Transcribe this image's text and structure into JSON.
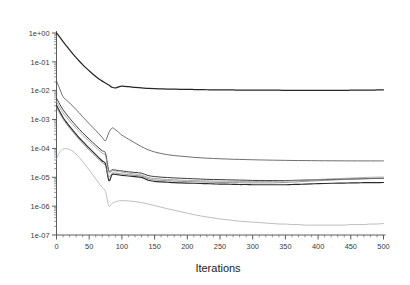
{
  "chart_data": {
    "type": "line",
    "title": "",
    "xlabel": "Iterations",
    "ylabel": "",
    "yscale": "log",
    "xlim": [
      0,
      500
    ],
    "ylim": [
      1e-07,
      1
    ],
    "grid": false,
    "legend": "none",
    "xticks": [
      0,
      50,
      100,
      150,
      200,
      250,
      300,
      350,
      400,
      450,
      500
    ],
    "xtick_labels": [
      "0",
      "50",
      "100",
      "150",
      "200",
      "250",
      "300",
      "350",
      "400",
      "450",
      "500"
    ],
    "yticks": [
      1,
      0.1,
      0.01,
      0.001,
      0.0001,
      1e-05,
      1e-06,
      1e-07
    ],
    "ytick_labels": [
      "1e+00",
      "1e-01",
      "1e-02",
      "1e-03",
      "1e-04",
      "1e-05",
      "1e-06",
      "1e-07"
    ],
    "x": [
      0,
      5,
      10,
      15,
      20,
      25,
      30,
      35,
      40,
      45,
      50,
      55,
      60,
      65,
      70,
      75,
      80,
      85,
      90,
      95,
      100,
      110,
      120,
      130,
      140,
      150,
      160,
      170,
      180,
      190,
      200,
      210,
      220,
      230,
      240,
      250,
      260,
      270,
      280,
      290,
      300,
      310,
      320,
      330,
      340,
      350,
      360,
      370,
      380,
      390,
      400,
      410,
      420,
      430,
      440,
      450,
      460,
      470,
      480,
      490,
      500
    ],
    "series": [
      {
        "name": "curve-1-top",
        "color": "#262626",
        "width": 1.25,
        "values": [
          1.0,
          0.72,
          0.5,
          0.36,
          0.26,
          0.19,
          0.14,
          0.105,
          0.08,
          0.062,
          0.049,
          0.039,
          0.031,
          0.0255,
          0.0215,
          0.0185,
          0.0158,
          0.0132,
          0.0125,
          0.0136,
          0.0143,
          0.0138,
          0.0131,
          0.0125,
          0.0121,
          0.0118,
          0.0116,
          0.0114,
          0.0113,
          0.0112,
          0.0111,
          0.011,
          0.0109,
          0.0108,
          0.0107,
          0.0107,
          0.0106,
          0.0106,
          0.0105,
          0.0105,
          0.0105,
          0.0104,
          0.0104,
          0.0104,
          0.0104,
          0.0103,
          0.0103,
          0.0103,
          0.0103,
          0.0103,
          0.0102,
          0.0102,
          0.0103,
          0.0103,
          0.0103,
          0.0104,
          0.0104,
          0.0105,
          0.0105,
          0.0106,
          0.0107
        ]
      },
      {
        "name": "curve-2",
        "color": "#555555",
        "width": 0.85,
        "values": [
          0.022,
          0.0115,
          0.0062,
          0.0048,
          0.0038,
          0.0029,
          0.0022,
          0.0017,
          0.00125,
          0.00095,
          0.00072,
          0.00055,
          0.00042,
          0.00032,
          0.00024,
          0.000185,
          0.00035,
          0.00051,
          0.00045,
          0.00036,
          0.00029,
          0.00021,
          0.000155,
          0.000115,
          9e-05,
          7.55e-05,
          6.65e-05,
          6.05e-05,
          5.65e-05,
          5.4e-05,
          5.15e-05,
          4.9e-05,
          4.75e-05,
          4.6e-05,
          4.48e-05,
          4.38e-05,
          4.3e-05,
          4.22e-05,
          4.16e-05,
          4.1e-05,
          4.05e-05,
          4e-05,
          3.96e-05,
          3.92e-05,
          3.89e-05,
          3.86e-05,
          3.83e-05,
          3.81e-05,
          3.79e-05,
          3.77e-05,
          3.75e-05,
          3.74e-05,
          3.73e-05,
          3.72e-05,
          3.71e-05,
          3.7e-05,
          3.7e-05,
          3.69e-05,
          3.69e-05,
          3.69e-05,
          3.69e-05
        ]
      },
      {
        "name": "curve-3",
        "color": "#3d3d3d",
        "width": 1.0,
        "values": [
          0.0055,
          0.0034,
          0.0022,
          0.00155,
          0.00112,
          0.00082,
          0.00061,
          0.00046,
          0.00035,
          0.00027,
          0.00021,
          0.000165,
          0.00013,
          0.000103,
          8.25e-05,
          6.72e-05,
          1.72e-05,
          1.82e-05,
          1.78e-05,
          1.72e-05,
          1.66e-05,
          1.55e-05,
          1.47e-05,
          1.39e-05,
          1.15e-05,
          1.06e-05,
          1.01e-05,
          9.8e-06,
          9.5e-06,
          9.3e-06,
          9.1e-06,
          8.9e-06,
          8.7e-06,
          8.5e-06,
          8.4e-06,
          8.3e-06,
          8.2e-06,
          8.1e-06,
          8e-06,
          7.9e-06,
          7.8e-06,
          7.7e-06,
          7.7e-06,
          7.7e-06,
          7.7e-06,
          7.7e-06,
          7.8e-06,
          7.9e-06,
          8e-06,
          8.1e-06,
          8.2e-06,
          8.3e-06,
          8.4e-06,
          8.5e-06,
          8.6e-06,
          8.7e-06,
          8.8e-06,
          8.9e-06,
          9e-06,
          9.1e-06,
          9.2e-06
        ]
      },
      {
        "name": "curve-4",
        "color": "#2b2b2b",
        "width": 1.15,
        "values": [
          0.0031,
          0.0019,
          0.00118,
          0.00082,
          0.00058,
          0.00042,
          0.00031,
          0.00023,
          0.000175,
          0.000133,
          0.000102,
          7.85e-05,
          6.08e-05,
          4.72e-05,
          3.68e-05,
          2.88e-05,
          7.8e-06,
          1.24e-05,
          1.25e-05,
          1.21e-05,
          1.17e-05,
          1.11e-05,
          1.05e-05,
          9.9e-06,
          7.9e-06,
          7.2e-06,
          6.9e-06,
          6.7e-06,
          6.5e-06,
          6.4e-06,
          6.3e-06,
          6.2e-06,
          6.1e-06,
          6e-06,
          5.9e-06,
          5.8e-06,
          5.8e-06,
          5.7e-06,
          5.6e-06,
          5.6e-06,
          5.5e-06,
          5.5e-06,
          5.5e-06,
          5.5e-06,
          5.5e-06,
          5.5e-06,
          5.6e-06,
          5.7e-06,
          5.8e-06,
          5.9e-06,
          6e-06,
          6.1e-06,
          6.2e-06,
          6.3e-06,
          6.3e-06,
          6.4e-06,
          6.4e-06,
          6.5e-06,
          6.5e-06,
          6.5e-06,
          6.6e-06
        ]
      },
      {
        "name": "curve-5",
        "color": "#7a7a7a",
        "width": 0.8,
        "values": [
          0.0027,
          0.00165,
          0.00104,
          0.00072,
          0.00051,
          0.00037,
          0.00027,
          0.0002,
          0.000152,
          0.000115,
          8.85e-05,
          6.82e-05,
          5.28e-05,
          4.1e-05,
          3.2e-05,
          2.5e-05,
          1.04e-05,
          1.38e-05,
          1.39e-05,
          1.35e-05,
          1.3e-05,
          1.23e-05,
          1.16e-05,
          1.1e-05,
          8.9e-06,
          8.1e-06,
          7.8e-06,
          7.6e-06,
          7.4e-06,
          7.2e-06,
          7.1e-06,
          7e-06,
          6.9e-06,
          6.8e-06,
          6.7e-06,
          6.6e-06,
          6.6e-06,
          6.5e-06,
          6.5e-06,
          6.4e-06,
          6.4e-06,
          6.4e-06,
          6.4e-06,
          6.4e-06,
          6.5e-06,
          6.6e-06,
          6.8e-06,
          7e-06,
          7.2e-06,
          7.4e-06,
          7.6e-06,
          7.8e-06,
          8e-06,
          8.2e-06,
          8.4e-06,
          8.6e-06,
          8.8e-06,
          9e-06,
          9.1e-06,
          9.2e-06,
          9.3e-06
        ]
      },
      {
        "name": "curve-6",
        "color": "#8f8f8f",
        "width": 0.75,
        "values": [
          0.0042,
          0.0026,
          0.0017,
          0.00122,
          0.00089,
          0.00066,
          0.0005,
          0.00038,
          0.00029,
          0.000225,
          0.000175,
          0.000137,
          0.000108,
          8.55e-05,
          6.82e-05,
          5.48e-05,
          1.48e-05,
          1.68e-05,
          1.65e-05,
          1.58e-05,
          1.51e-05,
          1.39e-05,
          1.29e-05,
          1.2e-05,
          9.8e-06,
          9.1e-06,
          8.7e-06,
          8.4e-06,
          8.2e-06,
          8e-06,
          7.8e-06,
          7.7e-06,
          7.6e-06,
          7.5e-06,
          7.4e-06,
          7.3e-06,
          7.3e-06,
          7.2e-06,
          7.2e-06,
          7.1e-06,
          7.1e-06,
          7.1e-06,
          7.1e-06,
          7.2e-06,
          7.3e-06,
          7.4e-06,
          7.6e-06,
          7.8e-06,
          8e-06,
          8.2e-06,
          8.4e-06,
          8.6e-06,
          8.8e-06,
          9e-06,
          9.2e-06,
          9.4e-06,
          9.6e-06,
          9.8e-06,
          1e-05,
          1.01e-05,
          1.02e-05
        ]
      },
      {
        "name": "curve-7-bottom",
        "color": "#a8a8a8",
        "width": 0.75,
        "values": [
          4.2e-05,
          7.55e-05,
          9.48e-05,
          9.8e-05,
          9.2e-05,
          7.95e-05,
          6.35e-05,
          4.82e-05,
          3.52e-05,
          2.52e-05,
          1.78e-05,
          1.25e-05,
          8.8e-06,
          6.2e-06,
          4.4e-06,
          3.2e-06,
          1.02e-06,
          1.25e-06,
          1.42e-06,
          1.52e-06,
          1.55e-06,
          1.52e-06,
          1.44e-06,
          1.33e-06,
          1.19e-06,
          1.05e-06,
          9.2e-07,
          8.1e-07,
          7.2e-07,
          6.4e-07,
          5.7e-07,
          5.1e-07,
          4.6e-07,
          4.2e-07,
          3.9e-07,
          3.6e-07,
          3.4e-07,
          3.2e-07,
          3e-07,
          2.9e-07,
          2.8e-07,
          2.7e-07,
          2.6e-07,
          2.5e-07,
          2.4e-07,
          2.4e-07,
          2.3e-07,
          2.3e-07,
          2.2e-07,
          2.2e-07,
          2.2e-07,
          2.2e-07,
          2.2e-07,
          2.2e-07,
          2.2e-07,
          2.3e-07,
          2.3e-07,
          2.3e-07,
          2.4e-07,
          2.4e-07,
          2.5e-07
        ]
      }
    ]
  }
}
